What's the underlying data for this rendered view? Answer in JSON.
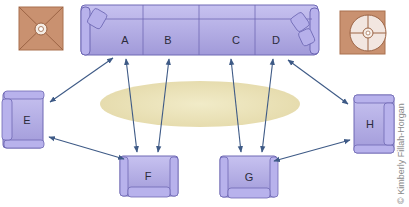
{
  "diagram": {
    "seats": [
      {
        "id": "A",
        "label": "A",
        "type": "sofa-section"
      },
      {
        "id": "B",
        "label": "B",
        "type": "sofa-section"
      },
      {
        "id": "C",
        "label": "C",
        "type": "sofa-section"
      },
      {
        "id": "D",
        "label": "D",
        "type": "sofa-section"
      },
      {
        "id": "E",
        "label": "E",
        "type": "armchair"
      },
      {
        "id": "F",
        "label": "F",
        "type": "armchair"
      },
      {
        "id": "G",
        "label": "G",
        "type": "armchair"
      },
      {
        "id": "H",
        "label": "H",
        "type": "armchair"
      }
    ],
    "connections": [
      {
        "from": "A",
        "to": "E",
        "bidirectional": true
      },
      {
        "from": "A",
        "to": "F",
        "bidirectional": true
      },
      {
        "from": "B",
        "to": "F",
        "bidirectional": true
      },
      {
        "from": "C",
        "to": "G",
        "bidirectional": true
      },
      {
        "from": "D",
        "to": "G",
        "bidirectional": true
      },
      {
        "from": "D",
        "to": "H",
        "bidirectional": true
      },
      {
        "from": "E",
        "to": "F",
        "bidirectional": true
      },
      {
        "from": "G",
        "to": "H",
        "bidirectional": true
      }
    ],
    "end_tables": [
      {
        "position": "left",
        "shape": "square-with-lamp"
      },
      {
        "position": "right",
        "shape": "square-with-round-lamp"
      }
    ],
    "rug": {
      "shape": "oval",
      "color": "#e9e1b8"
    },
    "colors": {
      "furniture_fill": "#a9a3e0",
      "furniture_stroke": "#6e68b4",
      "arrow": "#3e5a86",
      "table": "#c9906b"
    },
    "credit": "© Kimberly Fillah-Horgan"
  }
}
